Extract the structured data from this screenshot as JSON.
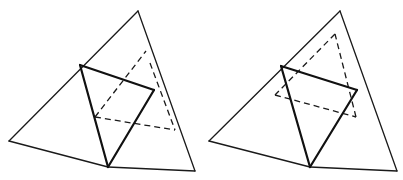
{
  "figure": {
    "colors": {
      "line": "#111111",
      "background": "#ffffff"
    },
    "left": {
      "outer_lines": [
        [
          [
            138,
            11
          ],
          [
            9,
            141
          ]
        ],
        [
          [
            9,
            141
          ],
          [
            108,
            167
          ]
        ],
        [
          [
            108,
            167
          ],
          [
            195,
            171
          ]
        ],
        [
          [
            195,
            171
          ],
          [
            138,
            11
          ]
        ]
      ],
      "bold_lines": [
        [
          [
            80,
            65
          ],
          [
            154,
            90
          ]
        ],
        [
          [
            80,
            65
          ],
          [
            108,
            167
          ]
        ],
        [
          [
            154,
            90
          ],
          [
            108,
            167
          ]
        ]
      ],
      "dashed_lines": [
        [
          [
            95,
            117
          ],
          [
            146,
            51
          ]
        ],
        [
          [
            95,
            117
          ],
          [
            175,
            130
          ]
        ],
        [
          [
            150,
            63
          ],
          [
            175,
            130
          ]
        ]
      ]
    },
    "right": {
      "outer_lines": [
        [
          [
            340,
            11
          ],
          [
            209,
            141
          ]
        ],
        [
          [
            209,
            141
          ],
          [
            310,
            167
          ]
        ],
        [
          [
            310,
            167
          ],
          [
            397,
            171
          ]
        ],
        [
          [
            397,
            171
          ],
          [
            340,
            11
          ]
        ]
      ],
      "bold_lines": [
        [
          [
            281,
            66
          ],
          [
            357,
            90
          ]
        ],
        [
          [
            281,
            66
          ],
          [
            310,
            167
          ]
        ],
        [
          [
            357,
            90
          ],
          [
            310,
            167
          ]
        ]
      ],
      "dashed_lines": [
        [
          [
            335,
            34
          ],
          [
            275,
            95
          ]
        ],
        [
          [
            275,
            95
          ],
          [
            356,
            117
          ]
        ],
        [
          [
            356,
            117
          ],
          [
            335,
            34
          ]
        ]
      ]
    }
  }
}
